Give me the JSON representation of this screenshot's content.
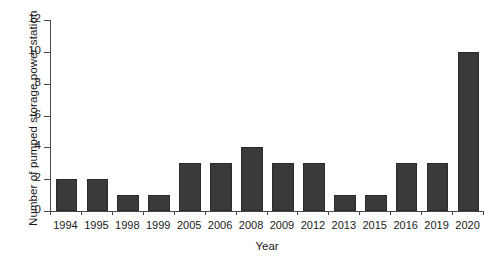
{
  "chart_data": {
    "type": "bar",
    "title": "",
    "subtitle": "",
    "xlabel": "Year",
    "ylabel": "Number of pumped storage power station",
    "categories": [
      "1994",
      "1995",
      "1998",
      "1999",
      "2005",
      "2006",
      "2008",
      "2009",
      "2012",
      "2013",
      "2015",
      "2016",
      "2019",
      "2020"
    ],
    "values": [
      2,
      2,
      1,
      1,
      3,
      3,
      4,
      3,
      3,
      1,
      1,
      3,
      3,
      10
    ],
    "series": [
      {
        "name": "Number of pumped storage power station",
        "values": [
          2,
          2,
          1,
          1,
          3,
          3,
          4,
          3,
          3,
          1,
          1,
          3,
          3,
          10
        ]
      }
    ],
    "ylim": [
      0,
      12
    ],
    "yticks": [
      0,
      2,
      4,
      6,
      8,
      10,
      12
    ],
    "ytick_labels": [
      "0",
      "2",
      "4",
      "6",
      "8",
      "10",
      "12"
    ],
    "grid": false,
    "legend": false,
    "legend_position": "none",
    "bar_color": "#3a3a3a",
    "axis_color": "#4a4a4a",
    "background_color": "#ffffff",
    "annotations": []
  }
}
